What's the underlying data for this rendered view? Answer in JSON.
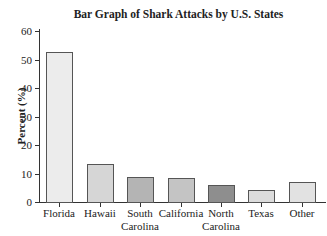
{
  "chart_data": {
    "type": "bar",
    "title": "Bar Graph of Shark Attacks by U.S. States",
    "xlabel": "",
    "ylabel": "Percent (%)",
    "ylim": [
      0,
      60
    ],
    "yticks": [
      0,
      10,
      20,
      30,
      40,
      50,
      60
    ],
    "grid": false,
    "categories": [
      "Florida",
      "Hawaii",
      "South Carolina",
      "California",
      "North Carolina",
      "Texas",
      "Other"
    ],
    "values": [
      52.6,
      13.3,
      8.8,
      8.4,
      6.0,
      4.2,
      7.0
    ],
    "colors": [
      "#ececec",
      "#d6d6d6",
      "#b4b4b4",
      "#c4c4c4",
      "#8e8e8e",
      "#dcdcdc",
      "#e2e2e2"
    ]
  },
  "labels": {
    "title": "Bar Graph of Shark Attacks by U.S. States",
    "ylabel": "Percent (%)",
    "yticks": [
      "0",
      "10",
      "20",
      "30",
      "40",
      "50",
      "60"
    ],
    "x": [
      [
        "Florida",
        ""
      ],
      [
        "Hawaii",
        ""
      ],
      [
        "South",
        "Carolina"
      ],
      [
        "California",
        ""
      ],
      [
        "North",
        "Carolina"
      ],
      [
        "Texas",
        ""
      ],
      [
        "Other",
        ""
      ]
    ]
  }
}
